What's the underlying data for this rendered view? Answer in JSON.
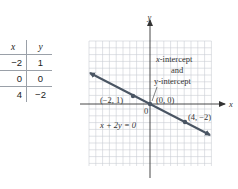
{
  "table": {
    "headers": [
      "x",
      "y"
    ],
    "rows": [
      {
        "x": "−2",
        "y": "1"
      },
      {
        "x": "0",
        "y": "0"
      },
      {
        "x": "4",
        "y": "−2"
      }
    ]
  },
  "graph": {
    "x_axis_label": "x",
    "y_axis_label": "y",
    "origin_label": "0",
    "equation": "x + 2y = 0",
    "annotation": {
      "line1": "x-intercept",
      "line2": "and",
      "line3": "y-intercept"
    },
    "points": [
      {
        "label": "(−2, 1)",
        "x": -2,
        "y": 1
      },
      {
        "label": "(0, 0)",
        "x": 0,
        "y": 0
      },
      {
        "label": "(4, −2)",
        "x": 4,
        "y": -2
      }
    ],
    "colors": {
      "line": "#4a5563",
      "grid": "#c9cdd3",
      "axis": "#333333"
    }
  }
}
